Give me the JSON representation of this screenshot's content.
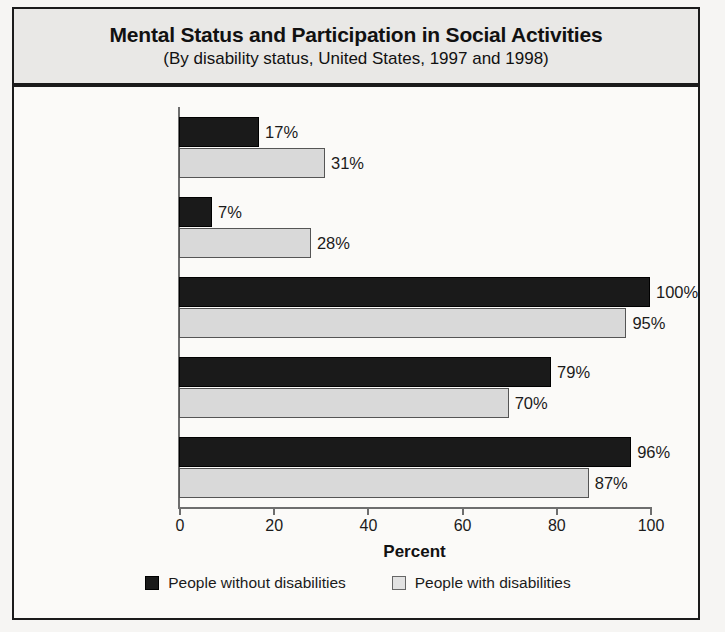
{
  "title": {
    "main": "Mental Status and Participation in Social Activities",
    "subtitle": "(By disability status, United States, 1997 and 1998)"
  },
  "axis": {
    "x_title": "Percent",
    "ticks": [
      "0",
      "20",
      "40",
      "60",
      "80",
      "100"
    ]
  },
  "legend": {
    "items": [
      {
        "label": "People without disabilities",
        "swatch": "dark-square-swatch",
        "color": "#1a1a1a"
      },
      {
        "label": "People with disabilities",
        "swatch": "light-square-swatch",
        "color": "#e2e2e2"
      }
    ]
  },
  "chart_data": {
    "type": "bar",
    "orientation": "horizontal",
    "title": "Mental Status and Participation in Social Activities",
    "subtitle": "(By disability status, United States, 1997 and 1998)",
    "xlabel": "Percent",
    "ylabel": "",
    "xlim": [
      0,
      100
    ],
    "xticks": [
      0,
      20,
      40,
      60,
      80,
      100
    ],
    "grid": false,
    "legend_position": "bottom",
    "categories": [
      "Children reported\nsad, unhappy,\ndepressed*",
      "Adults reported\nfeelings interfering\nwith activities*",
      "Adult participation\nin social activities*",
      "Adults reported\nsufficient\nemotional support**",
      "Adults reported\nsatisfaction\nwith life**"
    ],
    "series": [
      {
        "name": "People without disabilities",
        "color": "#1a1a1a",
        "values": [
          17,
          7,
          100,
          79,
          96
        ],
        "labels": [
          "17%",
          "7%",
          "100%",
          "79%",
          "96%"
        ]
      },
      {
        "name": "People with disabilities",
        "color": "#d9d9d9",
        "values": [
          31,
          28,
          95,
          70,
          87
        ],
        "labels": [
          "31%",
          "28%",
          "95%",
          "70%",
          "87%"
        ]
      }
    ]
  }
}
